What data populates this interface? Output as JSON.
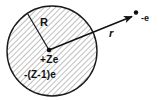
{
  "figure": {
    "background_color": "#ffffff",
    "stroke_color": "#1a1a1a",
    "hatch_color": "#9a9a9a"
  },
  "atom": {
    "radius_label": "R",
    "nucleus_charge_label": "+Ze",
    "cloud_charge_label": "-(Z-1)e",
    "circle": {
      "center_x": 52,
      "center_y": 51,
      "radius": 45,
      "fill": "hatched"
    },
    "center_dot": {
      "x": 49,
      "y": 50,
      "radius": 2.2
    },
    "radius_line": {
      "x1": 49,
      "y1": 50,
      "x2": 27,
      "y2": 13
    }
  },
  "electron": {
    "label": "-e",
    "dot": {
      "x": 136,
      "y": 13,
      "radius": 2.2
    }
  },
  "vector": {
    "label": "r",
    "arrow": {
      "x1": 49,
      "y1": 50,
      "x2": 133,
      "y2": 16
    }
  }
}
